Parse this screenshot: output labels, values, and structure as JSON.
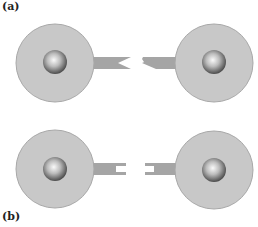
{
  "panels": [
    {
      "label": "(a)",
      "description": "Two cells with mismatched V-notch and arrow-tip connectors"
    },
    {
      "label": "(b)",
      "description": "Two cells with forked slot connectors facing each other"
    }
  ],
  "colors": {
    "cell_fill": "#c8c8c8",
    "cell_stroke": "#a8a8a8",
    "nucleus_outer": "#4a4a4a",
    "nucleus_inner": "#f2f2f2",
    "connector_fill": "#a5a5a5"
  }
}
